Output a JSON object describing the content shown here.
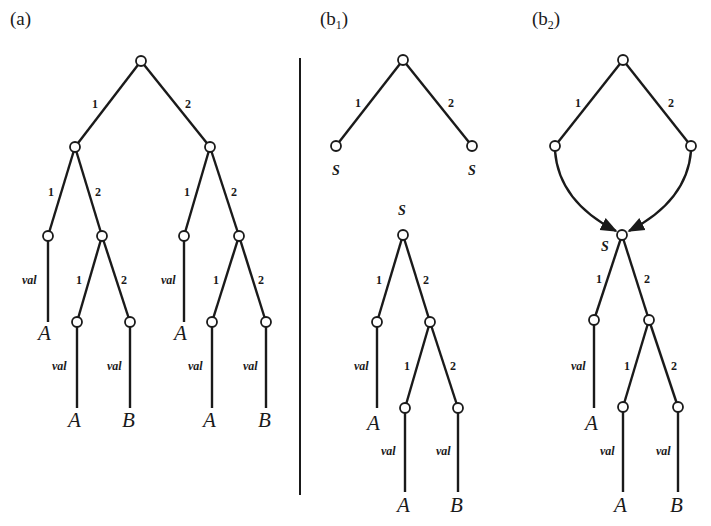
{
  "panels": {
    "a": {
      "label": "(a)"
    },
    "b1": {
      "label": "(b",
      "sub": "1",
      "close": ")"
    },
    "b2": {
      "label": "(b",
      "sub": "2",
      "close": ")"
    }
  },
  "edge_labels": {
    "one": "1",
    "two": "2",
    "val": "val"
  },
  "leaves": {
    "A": "A",
    "B": "B"
  },
  "shared_node_label": "S",
  "colors": {
    "ink": "#1a1a1a",
    "background": "#ffffff"
  }
}
